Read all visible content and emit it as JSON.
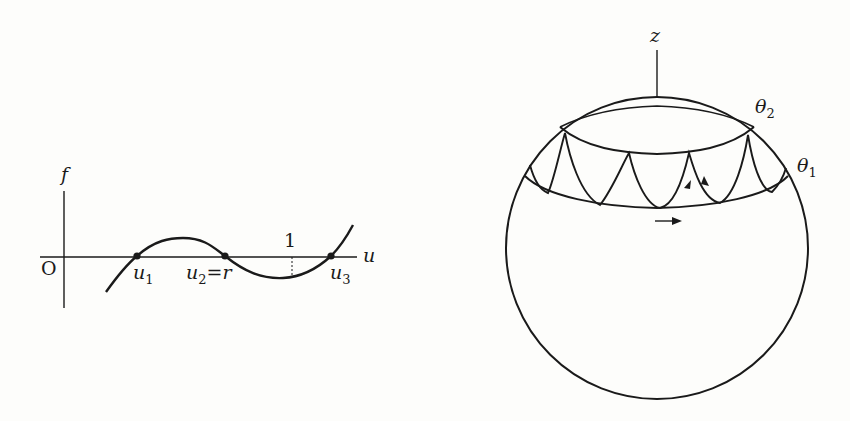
{
  "left_figure": {
    "axis_labels": {
      "y": "f",
      "x": "u",
      "origin": "O"
    },
    "tick_label": "1",
    "roots": [
      {
        "base": "u",
        "sub": "1",
        "suffix": ""
      },
      {
        "base": "u",
        "sub": "2",
        "suffix": "=r"
      },
      {
        "base": "u",
        "sub": "3",
        "suffix": ""
      }
    ]
  },
  "right_figure": {
    "axis_label": "z",
    "latitude_labels": [
      {
        "base": "θ",
        "sub": "2"
      },
      {
        "base": "θ",
        "sub": "1"
      }
    ]
  },
  "colors": {
    "ink": "#1a1a1a",
    "background": "#fdfdfb"
  }
}
